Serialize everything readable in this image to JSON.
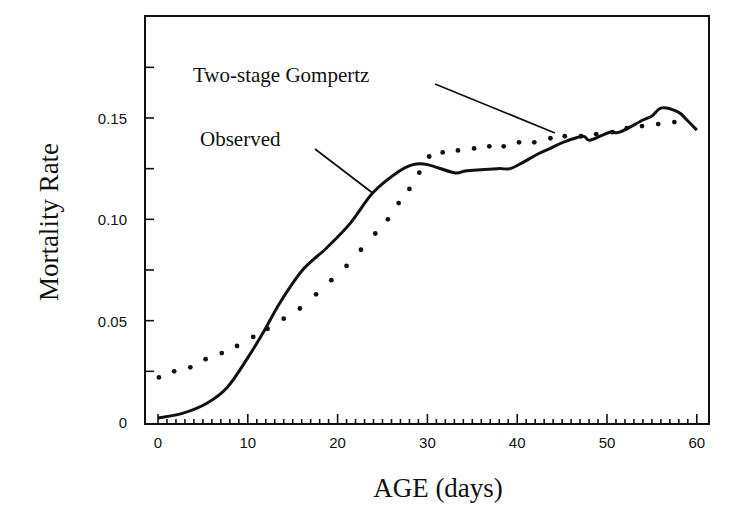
{
  "chart_data": {
    "type": "line",
    "title": "",
    "xlabel": "AGE (days)",
    "ylabel": "Mortality Rate",
    "xlim": [
      -1.4,
      61.4
    ],
    "ylim": [
      0,
      0.2
    ],
    "x_ticks": [
      0,
      10,
      20,
      30,
      40,
      50,
      60
    ],
    "x_tick_labels": [
      "0",
      "10",
      "20",
      "30",
      "40",
      "50",
      "60"
    ],
    "x_minor_step": 1,
    "y_ticks": [
      0,
      0.05,
      0.1,
      0.15
    ],
    "y_tick_labels": [
      "0",
      "0.05",
      "0.10",
      "0.15"
    ],
    "y_minor_step": 0.025,
    "grid": false,
    "legend": "none (inline annotations with leader lines)",
    "series": [
      {
        "name": "Observed",
        "style": "solid",
        "color": "#111111",
        "x": [
          0,
          2.8,
          5.5,
          7.7,
          9.9,
          11.7,
          13.6,
          16.1,
          18.8,
          21.4,
          23.9,
          26.6,
          28.4,
          30,
          33,
          34.4,
          37.8,
          39.2,
          40.6,
          42.2,
          43.7,
          45.1,
          47.3,
          48.1,
          50.3,
          51.4,
          54,
          55,
          56.1,
          57.9,
          58.9,
          60
        ],
        "values": [
          0.002,
          0.0044,
          0.0094,
          0.017,
          0.031,
          0.044,
          0.059,
          0.075,
          0.086,
          0.098,
          0.113,
          0.123,
          0.127,
          0.127,
          0.123,
          0.124,
          0.125,
          0.125,
          0.128,
          0.132,
          0.135,
          0.138,
          0.141,
          0.139,
          0.143,
          0.143,
          0.149,
          0.151,
          0.155,
          0.153,
          0.149,
          0.144
        ]
      },
      {
        "name": "Two-stage Gompertz",
        "style": "dotted",
        "color": "#111111",
        "x": [
          0.1,
          1.8,
          3.6,
          5.3,
          7.1,
          8.8,
          10.6,
          12.2,
          14,
          15.8,
          17.6,
          19.3,
          21,
          22.6,
          24.2,
          25.6,
          26.8,
          28,
          29.1,
          30.2,
          31.7,
          33.4,
          35.2,
          36.9,
          38.5,
          40.2,
          41.9,
          43.7,
          45.3,
          47.1,
          48.8,
          50.6,
          52.2,
          53.9,
          55.7,
          57.5
        ],
        "values": [
          0.022,
          0.025,
          0.027,
          0.031,
          0.034,
          0.0375,
          0.042,
          0.046,
          0.051,
          0.056,
          0.063,
          0.07,
          0.077,
          0.085,
          0.093,
          0.1,
          0.108,
          0.115,
          0.123,
          0.131,
          0.133,
          0.134,
          0.135,
          0.136,
          0.136,
          0.138,
          0.138,
          0.14,
          0.141,
          0.141,
          0.142,
          0.143,
          0.145,
          0.146,
          0.147,
          0.148
        ]
      }
    ],
    "annotations": [
      {
        "text": "Two-stage Gompertz",
        "target_series": "Two-stage Gompertz",
        "target_x": 44.2,
        "target_y": 0.142
      },
      {
        "text": "Observed",
        "target_series": "Observed",
        "target_x": 23.9,
        "target_y": 0.113
      }
    ]
  }
}
